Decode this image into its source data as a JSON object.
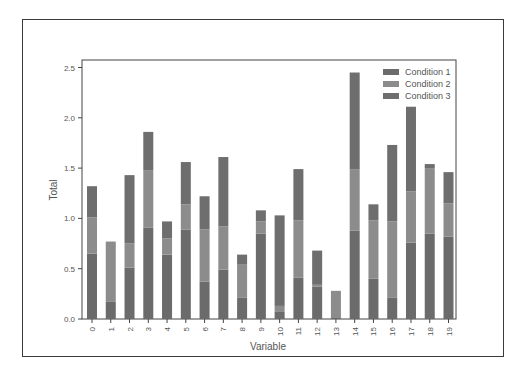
{
  "chart_data": {
    "type": "bar",
    "stacked": true,
    "title": "",
    "xlabel": "Variable",
    "ylabel": "Total",
    "ylim": [
      0,
      2.55
    ],
    "yticks": [
      "0.0",
      "0.5",
      "1.0",
      "1.5",
      "2.0",
      "2.5"
    ],
    "ytick_values": [
      0,
      0.5,
      1.0,
      1.5,
      2.0,
      2.5
    ],
    "categories": [
      "0",
      "1",
      "2",
      "3",
      "4",
      "5",
      "6",
      "7",
      "8",
      "9",
      "10",
      "11",
      "12",
      "13",
      "14",
      "15",
      "16",
      "17",
      "18",
      "19"
    ],
    "legend_position": "upper right",
    "grid": false,
    "series": [
      {
        "name": "Condition 1",
        "color": "#6b6b6b",
        "values": [
          0.65,
          0.17,
          0.51,
          0.91,
          0.64,
          0.89,
          0.37,
          0.49,
          0.21,
          0.85,
          0.07,
          0.41,
          0.32,
          0.01,
          0.88,
          0.4,
          0.21,
          0.76,
          0.85,
          0.82
        ]
      },
      {
        "name": "Condition 2",
        "color": "#8c8c8c",
        "values": [
          0.36,
          0.6,
          0.24,
          0.57,
          0.16,
          0.25,
          0.52,
          0.43,
          0.33,
          0.12,
          0.06,
          0.57,
          0.02,
          0.27,
          0.61,
          0.58,
          0.76,
          0.51,
          0.65,
          0.33
        ]
      },
      {
        "name": "Condition 3",
        "color": "#6e6e6e",
        "values": [
          0.31,
          0.0,
          0.68,
          0.38,
          0.17,
          0.42,
          0.33,
          0.69,
          0.1,
          0.11,
          0.9,
          0.51,
          0.34,
          0.0,
          0.96,
          0.16,
          0.76,
          0.84,
          0.04,
          0.31
        ]
      }
    ]
  }
}
